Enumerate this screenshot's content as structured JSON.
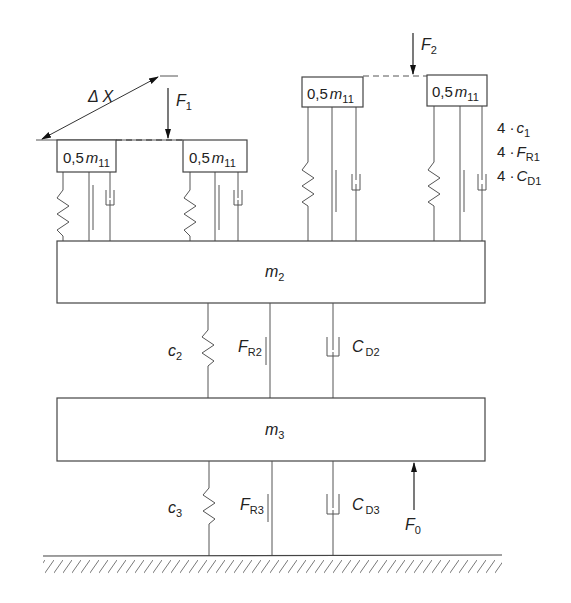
{
  "diagram": {
    "type": "multi-mass spring-damper-friction model",
    "small_masses": [
      {
        "label_coef": "0,5",
        "label_var": "m",
        "label_sub": "11"
      },
      {
        "label_coef": "0,5",
        "label_var": "m",
        "label_sub": "11"
      },
      {
        "label_coef": "0,5",
        "label_var": "m",
        "label_sub": "11"
      },
      {
        "label_coef": "0,5",
        "label_var": "m",
        "label_sub": "11"
      }
    ],
    "mass2": {
      "var": "m",
      "sub": "2"
    },
    "mass3": {
      "var": "m",
      "sub": "3"
    },
    "forces": {
      "f1": {
        "var": "F",
        "sub": "1"
      },
      "f2": {
        "var": "F",
        "sub": "2"
      },
      "f0": {
        "var": "F",
        "sub": "0"
      }
    },
    "delta_x": "Δ X",
    "level1_legend": [
      {
        "prefix": "4 ·",
        "var": "c",
        "sub": "1"
      },
      {
        "prefix": "4 ·",
        "var": "F",
        "sub": "R1"
      },
      {
        "prefix": "4 ·",
        "var": "C",
        "sub": "D1"
      }
    ],
    "level2": {
      "spring": {
        "var": "c",
        "sub": "2"
      },
      "friction": {
        "var": "F",
        "sub": "R2"
      },
      "damper": {
        "var": "C",
        "sub": "D2"
      }
    },
    "level3": {
      "spring": {
        "var": "c",
        "sub": "3"
      },
      "friction": {
        "var": "F",
        "sub": "R3"
      },
      "damper": {
        "var": "C",
        "sub": "D3"
      }
    }
  }
}
